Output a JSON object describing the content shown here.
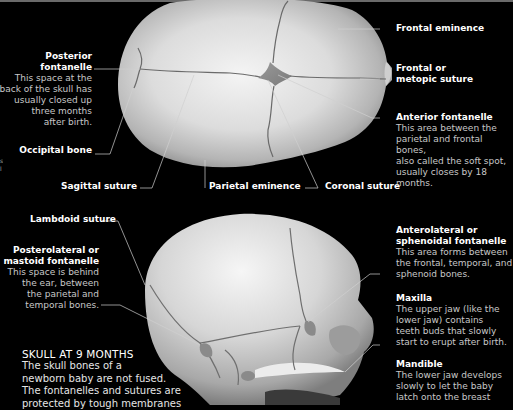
{
  "figure": {
    "caption": {
      "title": "SKULL AT 9 MONTHS",
      "lines": [
        "The skull bones of a",
        "newborn baby are not fused.",
        "The fontanelles and sutures are",
        "protected by tough membranes"
      ]
    },
    "edge_fragment": [
      "s",
      "l"
    ],
    "top_view": {
      "labels": {
        "posterior_fontanelle": {
          "title_lines": [
            "Posterior",
            "fontanelle"
          ],
          "desc_lines": [
            "This space at the",
            "back of the skull has",
            "usually closed up",
            "three months",
            "after birth."
          ]
        },
        "occipital_bone": {
          "title": "Occipital bone"
        },
        "sagittal_suture": {
          "title": "Sagittal suture"
        },
        "parietal_eminence": {
          "title": "Parietal eminence"
        },
        "coronal_suture": {
          "title": "Coronal suture"
        },
        "frontal_eminence": {
          "title": "Frontal eminence"
        },
        "frontal_suture": {
          "title_lines": [
            "Frontal or",
            "metopic suture"
          ]
        },
        "anterior_fontanelle": {
          "title": "Anterior fontanelle",
          "desc_lines": [
            "This area between the",
            "parietal and frontal bones,",
            "also called the soft spot,",
            "usually closes by 18 months."
          ]
        }
      }
    },
    "side_view": {
      "labels": {
        "lambdoid_suture": {
          "title": "Lambdoid suture"
        },
        "posterolateral_fontanelle": {
          "title_lines": [
            "Posterolateral or",
            "mastoid fontanelle"
          ],
          "desc_lines": [
            "This space is behind",
            "the ear, between",
            "the parietal and",
            "temporal bones."
          ]
        },
        "anterolateral_fontanelle": {
          "title_lines": [
            "Anterolateral or",
            "sphenoidal fontanelle"
          ],
          "desc_lines": [
            "This area forms between",
            "the frontal, temporal, and",
            "sphenoid bones."
          ]
        },
        "maxilla": {
          "title": "Maxilla",
          "desc_lines": [
            "The upper jaw (like the",
            "lower jaw) contains",
            "teeth buds that slowly",
            "start to erupt after birth."
          ]
        },
        "mandible": {
          "title": "Mandible",
          "desc_lines": [
            "The lower jaw develops",
            "slowly to let the baby",
            "latch onto the breast"
          ]
        }
      }
    }
  }
}
